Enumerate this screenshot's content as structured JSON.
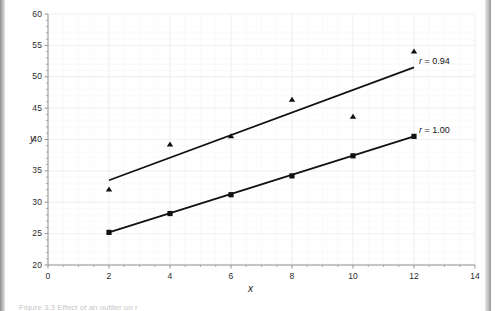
{
  "figure": {
    "axis_titles": {
      "x": "x",
      "y": "y"
    },
    "caption_remnant": "Figure 3.3 Effect of an outlier on r"
  },
  "chart_data": {
    "type": "scatter",
    "title": "",
    "xlabel": "x",
    "ylabel": "y",
    "xlim": [
      0,
      14
    ],
    "ylim": [
      20,
      60
    ],
    "x_major_step": 2,
    "x_minor_step": 0.5,
    "y_major_step": 5,
    "y_minor_step": 1,
    "grid": true,
    "grid_major_color": "#ededed",
    "grid_minor_color": "#f7f7f7",
    "legend": "inline-annotations",
    "xticks": [
      "0",
      "2",
      "4",
      "6",
      "8",
      "10",
      "12",
      "14"
    ],
    "yticks": [
      "20",
      "25",
      "30",
      "35",
      "40",
      "45",
      "50",
      "55",
      "60"
    ],
    "x": [
      2,
      4,
      6,
      8,
      10,
      12
    ],
    "series": [
      {
        "name": "r = 0.94",
        "marker": "triangle",
        "color": "#111111",
        "values": [
          32.0,
          39.2,
          40.5,
          46.3,
          43.6,
          54.0
        ],
        "trendline": {
          "x0": 2,
          "y0": 33.5,
          "x1": 12,
          "y1": 51.5
        },
        "annotation": {
          "r_symbol": "r",
          "text": " = 0.94"
        }
      },
      {
        "name": "r = 1.00",
        "marker": "square",
        "color": "#111111",
        "values": [
          25.2,
          28.2,
          31.2,
          34.2,
          37.4,
          40.5
        ],
        "trendline": {
          "x0": 2,
          "y0": 25.2,
          "x1": 12,
          "y1": 40.5
        },
        "annotation": {
          "r_symbol": "r",
          "text": " = 1.00"
        }
      }
    ]
  }
}
